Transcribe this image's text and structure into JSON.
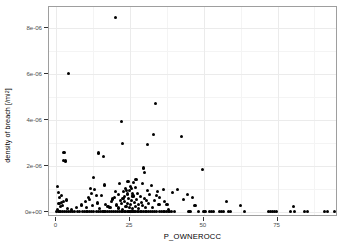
{
  "chart_data": {
    "type": "scatter",
    "title": "",
    "xlabel": "P_OWNEROCC",
    "ylabel": "density of breach [/mi2]",
    "ylabel_base": "density of breach [/mi",
    "ylabel_sup": "2",
    "ylabel_tail": "]",
    "xlim": [
      -2.5,
      95.5
    ],
    "ylim": [
      -2.2e-07,
      8.9e-06
    ],
    "grid": true,
    "legend": null,
    "xticks": [
      0,
      25,
      50,
      75
    ],
    "xtick_labels": [
      "0",
      "25",
      "50",
      "75"
    ],
    "yticks": [
      0,
      2e-06,
      4e-06,
      6e-06,
      8e-06
    ],
    "ytick_labels": [
      "0e+00",
      "2e-06",
      "4e-06",
      "6e-06",
      "8e-06"
    ],
    "xminor": [
      12.5,
      37.5,
      62.5,
      87.5
    ],
    "yminor": [
      1e-06,
      3e-06,
      5e-06,
      7e-06
    ],
    "point_color": "#000000",
    "panel_border_color": "#9e9e9e",
    "grid_major_color": "#ebebeb",
    "grid_minor_color": "#f4f4f4",
    "n_points": 201,
    "points": [
      [
        20.2,
        8.45e-06
      ],
      [
        4.1,
        6.02e-06
      ],
      [
        33.6,
        4.72e-06
      ],
      [
        22.2,
        3.92e-06
      ],
      [
        33.0,
        3.38e-06
      ],
      [
        42.4,
        3.26e-06
      ],
      [
        22.4,
        2.97e-06
      ],
      [
        31.0,
        2.92e-06
      ],
      [
        2.6,
        2.6e-06
      ],
      [
        14.2,
        2.56e-06
      ],
      [
        15.9,
        2.41e-06
      ],
      [
        2.3,
        2.22e-06
      ],
      [
        3.0,
        2.21e-06
      ],
      [
        29.4,
        1.91e-06
      ],
      [
        49.5,
        1.86e-06
      ],
      [
        30.0,
        1.72e-06
      ],
      [
        12.6,
        1.49e-06
      ],
      [
        27.0,
        1.4e-06
      ],
      [
        24.3,
        1.33e-06
      ],
      [
        26.2,
        1.28e-06
      ],
      [
        21.5,
        1.25e-06
      ],
      [
        29.1,
        1.22e-06
      ],
      [
        16.2,
        1.17e-06
      ],
      [
        32.2,
        1.14e-06
      ],
      [
        25.1,
        1.12e-06
      ],
      [
        0.5,
        1.1e-06
      ],
      [
        26.7,
        1.08e-06
      ],
      [
        11.6,
        1.03e-06
      ],
      [
        23.4,
        1.01e-06
      ],
      [
        25.6,
        1e-06
      ],
      [
        36.3,
        9.9e-07
      ],
      [
        41.0,
        9.8e-07
      ],
      [
        13.0,
        9.6e-07
      ],
      [
        23.8,
        9.4e-07
      ],
      [
        24.9,
        9.2e-07
      ],
      [
        22.8,
        9e-07
      ],
      [
        34.4,
        8.8e-07
      ],
      [
        39.3,
        8.5e-07
      ],
      [
        0.7,
        8.4e-07
      ],
      [
        25.9,
        8.2e-07
      ],
      [
        12.0,
        8e-07
      ],
      [
        27.6,
        7.9e-07
      ],
      [
        24.0,
        7.8e-07
      ],
      [
        44.5,
        7.7e-07
      ],
      [
        21.0,
        7.6e-07
      ],
      [
        31.7,
        7.4e-07
      ],
      [
        13.6,
        7.2e-07
      ],
      [
        15.2,
        7e-07
      ],
      [
        26.0,
        6.9e-07
      ],
      [
        23.0,
        6.8e-07
      ],
      [
        28.4,
        6.6e-07
      ],
      [
        10.9,
        6.4e-07
      ],
      [
        1.1,
        6.3e-07
      ],
      [
        35.0,
        6.2e-07
      ],
      [
        46.2,
        6.1e-07
      ],
      [
        22.6,
        6e-07
      ],
      [
        29.8,
        5.8e-07
      ],
      [
        24.5,
        5.7e-07
      ],
      [
        19.0,
        5.6e-07
      ],
      [
        11.2,
        5.5e-07
      ],
      [
        27.2,
        5.4e-07
      ],
      [
        3.4,
        5.2e-07
      ],
      [
        33.2,
        5.1e-07
      ],
      [
        25.4,
        5e-07
      ],
      [
        30.6,
        4.9e-07
      ],
      [
        21.8,
        4.8e-07
      ],
      [
        57.8,
        4.7e-07
      ],
      [
        9.8,
        4.6e-07
      ],
      [
        23.2,
        4.5e-07
      ],
      [
        36.8,
        4.4e-07
      ],
      [
        26.4,
        4.2e-07
      ],
      [
        1.6,
        4.1e-07
      ],
      [
        28.8,
        4e-07
      ],
      [
        13.9,
        3.9e-07
      ],
      [
        24.2,
        3.8e-07
      ],
      [
        31.3,
        3.7e-07
      ],
      [
        22.0,
        3.6e-07
      ],
      [
        0.9,
        3.5e-07
      ],
      [
        27.8,
        3.4e-07
      ],
      [
        16.8,
        3.3e-07
      ],
      [
        25.0,
        3.2e-07
      ],
      [
        34.8,
        3.1e-07
      ],
      [
        20.5,
        3e-07
      ],
      [
        62.5,
        2.9e-07
      ],
      [
        2.0,
        2.8e-07
      ],
      [
        29.2,
        2.7e-07
      ],
      [
        12.3,
        2.6e-07
      ],
      [
        23.6,
        2.5e-07
      ],
      [
        80.3,
        2.4e-07
      ],
      [
        26.8,
        2.3e-07
      ],
      [
        1.4,
        2.2e-07
      ],
      [
        30.2,
        2.1e-07
      ],
      [
        18.2,
        2e-07
      ],
      [
        24.7,
        1.9e-07
      ],
      [
        32.6,
        1.8e-07
      ],
      [
        21.2,
        1.7e-07
      ],
      [
        3.8,
        1.6e-07
      ],
      [
        28.0,
        1.5e-07
      ],
      [
        14.6,
        1.4e-07
      ],
      [
        25.8,
        1.3e-07
      ],
      [
        38.0,
        1.2e-07
      ],
      [
        22.4,
        1.1e-07
      ],
      [
        0.4,
        1e-07
      ],
      [
        0.0,
        0.0
      ],
      [
        0.6,
        0.0
      ],
      [
        1.0,
        0.0
      ],
      [
        1.5,
        0.0
      ],
      [
        2.1,
        0.0
      ],
      [
        2.7,
        0.0
      ],
      [
        3.3,
        0.0
      ],
      [
        4.0,
        0.0
      ],
      [
        4.8,
        0.0
      ],
      [
        5.5,
        0.0
      ],
      [
        6.3,
        0.0
      ],
      [
        7.1,
        0.0
      ],
      [
        7.9,
        0.0
      ],
      [
        8.8,
        0.0
      ],
      [
        9.6,
        0.0
      ],
      [
        10.4,
        0.0
      ],
      [
        11.1,
        0.0
      ],
      [
        11.9,
        0.0
      ],
      [
        12.7,
        0.0
      ],
      [
        13.5,
        0.0
      ],
      [
        14.3,
        0.0
      ],
      [
        15.1,
        0.0
      ],
      [
        15.8,
        0.0
      ],
      [
        16.5,
        0.0
      ],
      [
        17.3,
        0.0
      ],
      [
        18.0,
        0.0
      ],
      [
        18.7,
        0.0
      ],
      [
        19.4,
        0.0
      ],
      [
        20.1,
        0.0
      ],
      [
        20.8,
        0.0
      ],
      [
        21.4,
        0.0
      ],
      [
        22.0,
        0.0
      ],
      [
        22.5,
        0.0
      ],
      [
        23.0,
        0.0
      ],
      [
        23.5,
        0.0
      ],
      [
        24.0,
        0.0
      ],
      [
        24.4,
        0.0
      ],
      [
        24.8,
        0.0
      ],
      [
        25.2,
        0.0
      ],
      [
        25.6,
        0.0
      ],
      [
        26.0,
        0.0
      ],
      [
        26.4,
        0.0
      ],
      [
        26.9,
        0.0
      ],
      [
        27.4,
        0.0
      ],
      [
        27.9,
        0.0
      ],
      [
        28.4,
        0.0
      ],
      [
        28.9,
        0.0
      ],
      [
        29.5,
        0.0
      ],
      [
        30.1,
        0.0
      ],
      [
        30.7,
        0.0
      ],
      [
        31.3,
        0.0
      ],
      [
        32.0,
        0.0
      ],
      [
        32.7,
        0.0
      ],
      [
        33.4,
        0.0
      ],
      [
        34.1,
        0.0
      ],
      [
        34.9,
        0.0
      ],
      [
        35.7,
        0.0
      ],
      [
        36.5,
        0.0
      ],
      [
        37.3,
        0.0
      ],
      [
        38.2,
        0.0
      ],
      [
        39.1,
        0.0
      ],
      [
        40.0,
        0.0
      ],
      [
        44.8,
        0.0
      ],
      [
        45.3,
        0.0
      ],
      [
        48.2,
        0.0
      ],
      [
        49.8,
        0.0
      ],
      [
        50.4,
        0.0
      ],
      [
        52.0,
        0.0
      ],
      [
        52.6,
        0.0
      ],
      [
        53.2,
        0.0
      ],
      [
        55.4,
        0.0
      ],
      [
        56.1,
        0.0
      ],
      [
        56.8,
        0.0
      ],
      [
        58.5,
        0.0
      ],
      [
        59.2,
        0.0
      ],
      [
        63.8,
        0.0
      ],
      [
        71.8,
        0.0
      ],
      [
        72.5,
        0.0
      ],
      [
        73.2,
        0.0
      ],
      [
        74.0,
        0.0
      ],
      [
        74.6,
        0.0
      ],
      [
        79.5,
        0.0
      ],
      [
        80.6,
        0.0
      ],
      [
        84.2,
        0.0
      ],
      [
        85.3,
        0.0
      ],
      [
        90.8,
        0.0
      ],
      [
        92.0,
        0.0
      ],
      [
        94.2,
        0.0
      ],
      [
        6.8,
        1.8e-07
      ],
      [
        17.5,
        2.5e-07
      ],
      [
        19.8,
        6.2e-07
      ],
      [
        31.0,
        9.5e-07
      ],
      [
        37.5,
        3.3e-07
      ],
      [
        43.0,
        5.5e-07
      ],
      [
        5.2,
        1.2e-07
      ],
      [
        8.4,
        3e-07
      ],
      [
        10.1,
        2.1e-07
      ],
      [
        18.6,
        4.4e-07
      ],
      [
        33.8,
        7e-07
      ],
      [
        47.0,
        2.6e-07
      ],
      [
        1.8,
        7.2e-07
      ],
      [
        2.4,
        4.5e-07
      ],
      [
        20.0,
        8.8e-07
      ]
    ]
  }
}
